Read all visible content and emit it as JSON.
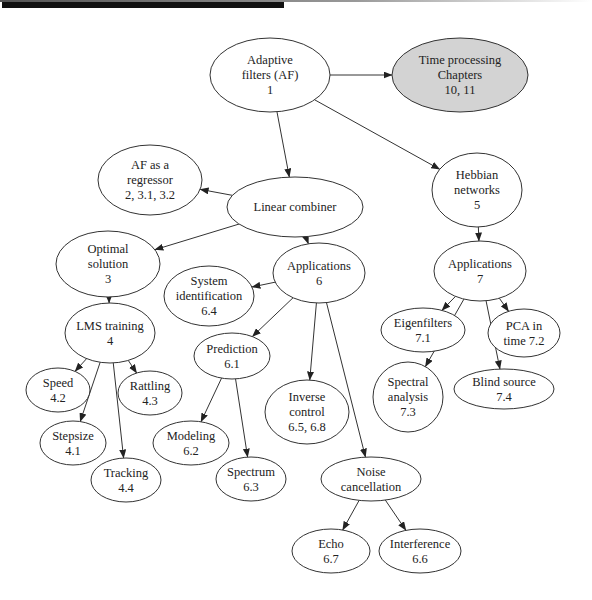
{
  "diagram": {
    "type": "concept-map",
    "nodes": [
      {
        "id": "af",
        "lines": [
          "Adaptive",
          "filters (AF)",
          "1"
        ],
        "cx": 270,
        "cy": 75,
        "rx": 60,
        "ry": 37,
        "shaded": false
      },
      {
        "id": "time",
        "lines": [
          "Time processing",
          "Chapters",
          "10, 11"
        ],
        "cx": 460,
        "cy": 75,
        "rx": 68,
        "ry": 37,
        "shaded": true
      },
      {
        "id": "regressor",
        "lines": [
          "AF as a",
          "regressor",
          "2, 3.1, 3.2"
        ],
        "cx": 150,
        "cy": 180,
        "rx": 52,
        "ry": 35,
        "shaded": false
      },
      {
        "id": "linear",
        "lines": [
          "Linear combiner"
        ],
        "cx": 295,
        "cy": 207,
        "rx": 68,
        "ry": 30,
        "shaded": false
      },
      {
        "id": "hebbian",
        "lines": [
          "Hebbian",
          "networks",
          "5"
        ],
        "cx": 477,
        "cy": 190,
        "rx": 45,
        "ry": 37,
        "shaded": false
      },
      {
        "id": "optimal",
        "lines": [
          "Optimal",
          "solution",
          "3"
        ],
        "cx": 108,
        "cy": 264,
        "rx": 52,
        "ry": 33,
        "shaded": false
      },
      {
        "id": "app6",
        "lines": [
          "Applications",
          "6"
        ],
        "cx": 319,
        "cy": 273,
        "rx": 46,
        "ry": 30,
        "shaded": false
      },
      {
        "id": "app7",
        "lines": [
          "Applications",
          "7"
        ],
        "cx": 480,
        "cy": 271,
        "rx": 46,
        "ry": 30,
        "shaded": false
      },
      {
        "id": "sysid",
        "lines": [
          "System",
          "identification",
          "6.4"
        ],
        "cx": 209,
        "cy": 296,
        "rx": 45,
        "ry": 30,
        "shaded": false
      },
      {
        "id": "lms",
        "lines": [
          "LMS training",
          "4"
        ],
        "cx": 110,
        "cy": 333,
        "rx": 45,
        "ry": 30,
        "shaded": false
      },
      {
        "id": "eigen",
        "lines": [
          "Eigenfilters",
          "7.1"
        ],
        "cx": 423,
        "cy": 330,
        "rx": 42,
        "ry": 22,
        "shaded": false
      },
      {
        "id": "pca",
        "lines": [
          "PCA in",
          "time 7.2"
        ],
        "cx": 524,
        "cy": 333,
        "rx": 36,
        "ry": 24,
        "shaded": false
      },
      {
        "id": "prediction",
        "lines": [
          "Prediction",
          "6.1"
        ],
        "cx": 232,
        "cy": 356,
        "rx": 38,
        "ry": 23,
        "shaded": false
      },
      {
        "id": "speed",
        "lines": [
          "Speed",
          "4.2"
        ],
        "cx": 58,
        "cy": 390,
        "rx": 32,
        "ry": 22,
        "shaded": false
      },
      {
        "id": "rattling",
        "lines": [
          "Rattling",
          "4.3"
        ],
        "cx": 150,
        "cy": 393,
        "rx": 32,
        "ry": 22,
        "shaded": false
      },
      {
        "id": "inverse",
        "lines": [
          "Inverse",
          "control",
          "6.5, 6.8"
        ],
        "cx": 307,
        "cy": 412,
        "rx": 42,
        "ry": 32,
        "shaded": false
      },
      {
        "id": "spectral",
        "lines": [
          "Spectral",
          "analysis",
          "7.3"
        ],
        "cx": 408,
        "cy": 397,
        "rx": 35,
        "ry": 35,
        "shaded": false
      },
      {
        "id": "blind",
        "lines": [
          "Blind source",
          "7.4"
        ],
        "cx": 504,
        "cy": 389,
        "rx": 50,
        "ry": 20,
        "shaded": false
      },
      {
        "id": "stepsize",
        "lines": [
          "Stepsize",
          "4.1"
        ],
        "cx": 73,
        "cy": 443,
        "rx": 33,
        "ry": 22,
        "shaded": false
      },
      {
        "id": "modeling",
        "lines": [
          "Modeling",
          "6.2"
        ],
        "cx": 191,
        "cy": 443,
        "rx": 38,
        "ry": 22,
        "shaded": false
      },
      {
        "id": "tracking",
        "lines": [
          "Tracking",
          "4.4"
        ],
        "cx": 126,
        "cy": 480,
        "rx": 35,
        "ry": 22,
        "shaded": false
      },
      {
        "id": "spectrum",
        "lines": [
          "Spectrum",
          "6.3"
        ],
        "cx": 251,
        "cy": 479,
        "rx": 35,
        "ry": 22,
        "shaded": false
      },
      {
        "id": "noise",
        "lines": [
          "Noise",
          "cancellation"
        ],
        "cx": 371,
        "cy": 479,
        "rx": 50,
        "ry": 22,
        "shaded": false
      },
      {
        "id": "echo",
        "lines": [
          "Echo",
          "6.7"
        ],
        "cx": 331,
        "cy": 551,
        "rx": 39,
        "ry": 22,
        "shaded": false
      },
      {
        "id": "interference",
        "lines": [
          "Interference",
          "6.6"
        ],
        "cx": 420,
        "cy": 551,
        "rx": 41,
        "ry": 22,
        "shaded": false
      }
    ],
    "edges": [
      {
        "from": "af",
        "to": "time"
      },
      {
        "from": "af",
        "to": "linear"
      },
      {
        "from": "af",
        "to": "hebbian"
      },
      {
        "from": "linear",
        "to": "regressor"
      },
      {
        "from": "linear",
        "to": "optimal"
      },
      {
        "from": "linear",
        "to": "app6"
      },
      {
        "from": "hebbian",
        "to": "app7"
      },
      {
        "from": "optimal",
        "to": "lms"
      },
      {
        "from": "app6",
        "to": "sysid"
      },
      {
        "from": "app6",
        "to": "prediction"
      },
      {
        "from": "app6",
        "to": "inverse"
      },
      {
        "from": "app6",
        "to": "noise"
      },
      {
        "from": "app7",
        "to": "eigen"
      },
      {
        "from": "app7",
        "to": "pca"
      },
      {
        "from": "app7",
        "to": "spectral"
      },
      {
        "from": "app7",
        "to": "blind"
      },
      {
        "from": "lms",
        "to": "speed"
      },
      {
        "from": "lms",
        "to": "rattling"
      },
      {
        "from": "lms",
        "to": "stepsize"
      },
      {
        "from": "lms",
        "to": "tracking"
      },
      {
        "from": "prediction",
        "to": "modeling"
      },
      {
        "from": "prediction",
        "to": "spectrum"
      },
      {
        "from": "noise",
        "to": "echo"
      },
      {
        "from": "noise",
        "to": "interference"
      }
    ],
    "colors": {
      "shaded_fill": "#d3d3d3",
      "stroke": "#333333"
    }
  }
}
